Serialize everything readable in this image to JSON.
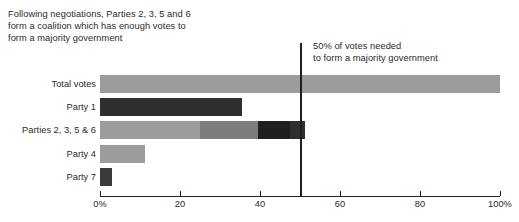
{
  "annotations": {
    "coalition_note": "Following negotiations, Parties 2, 3, 5 and 6\nform a coalition which has enough votes to\nform a majority government",
    "majority_note": "50% of votes needed\nto form a majority government"
  },
  "chart_data": {
    "type": "bar",
    "orientation": "horizontal",
    "stacked": true,
    "title": "",
    "xlabel": "",
    "ylabel": "",
    "xlim": [
      0,
      100
    ],
    "grid": false,
    "legend": "none",
    "xticks": [
      0,
      20,
      40,
      60,
      80,
      100
    ],
    "xtick_labels": [
      "0%",
      "20",
      "40",
      "60",
      "80",
      "100%"
    ],
    "categories": [
      "Total votes",
      "Party 1",
      "Parties 2, 3, 5 & 6",
      "Party 4",
      "Party 7"
    ],
    "rows": [
      {
        "label": "Total votes",
        "total": 100,
        "segments": [
          {
            "name": "total-votes",
            "value": 100,
            "color": "#9c9c9c"
          }
        ]
      },
      {
        "label": "Party 1",
        "total": 35.5,
        "segments": [
          {
            "name": "party-1",
            "value": 35.5,
            "color": "#2f2f2f"
          }
        ]
      },
      {
        "label": "Parties 2, 3, 5 & 6",
        "total": 51.2,
        "segments": [
          {
            "name": "party-2",
            "value": 25.0,
            "color": "#9c9c9c"
          },
          {
            "name": "party-3",
            "value": 14.5,
            "color": "#7d7d7d"
          },
          {
            "name": "party-5",
            "value": 8.0,
            "color": "#1f1f1f"
          },
          {
            "name": "party-6",
            "value": 3.7,
            "color": "#2f2f2f"
          }
        ]
      },
      {
        "label": "Party 4",
        "total": 11.2,
        "segments": [
          {
            "name": "party-4",
            "value": 11.2,
            "color": "#9c9c9c"
          }
        ]
      },
      {
        "label": "Party 7",
        "total": 3.0,
        "segments": [
          {
            "name": "party-7",
            "value": 3.0,
            "color": "#3a3a3a"
          }
        ]
      }
    ],
    "reference_line": {
      "name": "majority-threshold",
      "value": 50,
      "color": "#231f20",
      "label": "50% of votes needed\nto form a majority government"
    }
  },
  "axis": {
    "tick_labels": [
      "0%",
      "20",
      "40",
      "60",
      "80",
      "100%"
    ]
  }
}
